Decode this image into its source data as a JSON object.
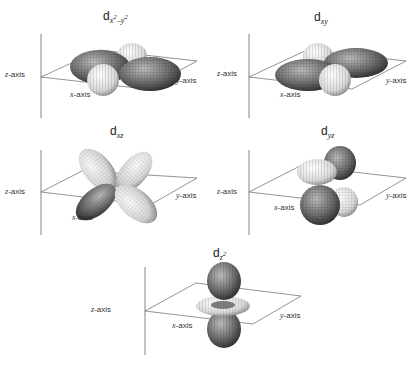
{
  "figure": {
    "panels": [
      {
        "id": "dx2y2",
        "title_main": "d",
        "title_sub": "x",
        "title_sup1": "2",
        "title_sub2": "–y",
        "title_sup2": "2",
        "z_label": "z",
        "x_label": "x",
        "y_label": "y",
        "axis_suffix": "-axis"
      },
      {
        "id": "dxy",
        "title_main": "d",
        "title_sub": "xy",
        "z_label": "z",
        "x_label": "x",
        "y_label": "y",
        "axis_suffix": "-axis"
      },
      {
        "id": "dxz",
        "title_main": "d",
        "title_sub": "xz",
        "z_label": "z",
        "x_label": "x",
        "y_label": "y",
        "axis_suffix": "-axis"
      },
      {
        "id": "dyz",
        "title_main": "d",
        "title_sub": "yz",
        "z_label": "z",
        "x_label": "x",
        "y_label": "y",
        "axis_suffix": "-axis"
      },
      {
        "id": "dz2",
        "title_main": "d",
        "title_sub": "z",
        "title_sup": "2",
        "z_label": "z",
        "x_label": "x",
        "y_label": "y",
        "axis_suffix": "-axis"
      }
    ]
  },
  "colors": {
    "line": "#555555",
    "lobe_dark": "#6e6e6e",
    "lobe_light": "#e8e8e8",
    "mesh": "#333333"
  }
}
